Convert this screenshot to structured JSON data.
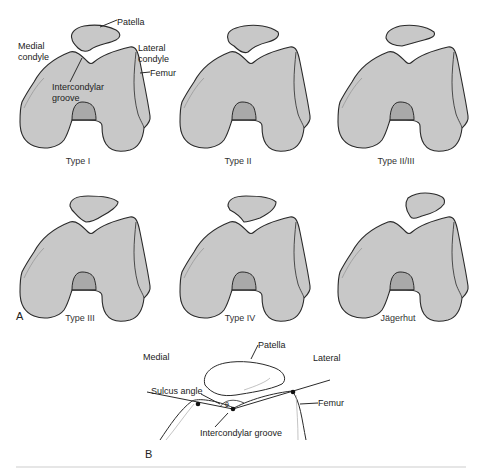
{
  "panel_a": {
    "label": "A",
    "annotations": {
      "patella": "Patella",
      "medial_condyle_1": "Medial",
      "medial_condyle_2": "condyle",
      "lateral_condyle_1": "Lateral",
      "lateral_condyle_2": "condyle",
      "femur": "Femur",
      "groove_1": "Intercondylar",
      "groove_2": "groove"
    },
    "types": [
      {
        "label": "Type I"
      },
      {
        "label": "Type II"
      },
      {
        "label": "Type II/III"
      },
      {
        "label": "Type III"
      },
      {
        "label": "Type IV"
      },
      {
        "label": "Jägerhut"
      }
    ]
  },
  "panel_b": {
    "label": "B",
    "medial": "Medial",
    "lateral": "Lateral",
    "patella": "Patella",
    "sulcus_angle": "Sulcus angle",
    "theta": "θ",
    "femur": "Femur",
    "groove": "Intercondylar groove"
  },
  "colors": {
    "bone_fill": "#c8c8c8",
    "notch_fill": "#a9a9a9",
    "outline": "#2a2a2a"
  }
}
